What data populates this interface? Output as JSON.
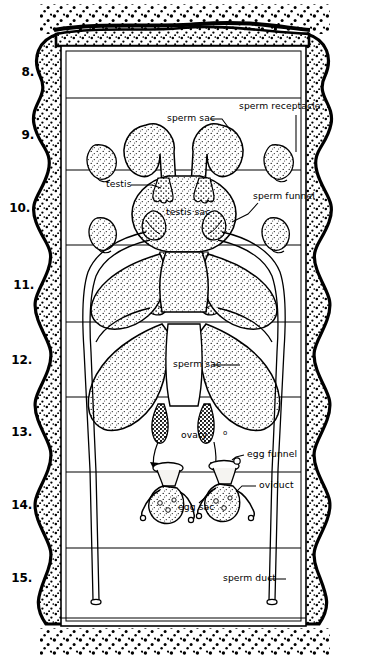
{
  "figure": {
    "background_color": "#ffffff",
    "ink_color": "#000000",
    "stipple_color": "#1a1a1a",
    "organ_fill": "#f2f0ec",
    "width": 365,
    "height": 659
  },
  "segment_numbers": [
    {
      "label": "8.",
      "x": 8,
      "y": 65
    },
    {
      "label": "9.",
      "x": 8,
      "y": 128
    },
    {
      "label": "10.",
      "x": 4,
      "y": 201
    },
    {
      "label": "11.",
      "x": 8,
      "y": 278
    },
    {
      "label": "12.",
      "x": 6,
      "y": 353
    },
    {
      "label": "13.",
      "x": 6,
      "y": 425
    },
    {
      "label": "14.",
      "x": 6,
      "y": 498
    },
    {
      "label": "15.",
      "x": 6,
      "y": 571
    }
  ],
  "labels": [
    {
      "name": "sperm-sac-upper",
      "text": "sperm sac",
      "x": 167,
      "y": 116
    },
    {
      "name": "sperm-receptacle",
      "text": "sperm receptacle",
      "x": 239,
      "y": 104
    },
    {
      "name": "testis",
      "text": "testis",
      "x": 106,
      "y": 182
    },
    {
      "name": "sperm-funnel",
      "text": "sperm funnel",
      "x": 253,
      "y": 194
    },
    {
      "name": "testis-sac",
      "text": "testis sac",
      "x": 166,
      "y": 210
    },
    {
      "name": "sperm-sac-lower",
      "text": "sperm sac",
      "x": 173,
      "y": 362
    },
    {
      "name": "ovary",
      "text": "ovary",
      "x": 181,
      "y": 433
    },
    {
      "name": "egg-funnel",
      "text": "egg funnel",
      "x": 247,
      "y": 452
    },
    {
      "name": "oviduct",
      "text": "oviduct",
      "x": 259,
      "y": 483
    },
    {
      "name": "egg-sac",
      "text": "egg sac",
      "x": 178,
      "y": 505
    },
    {
      "name": "sperm-duct",
      "text": "sperm duct",
      "x": 223,
      "y": 576
    }
  ],
  "ovum_glyph": {
    "name": "ovum-marker",
    "text": "o",
    "x": 223,
    "y": 432
  },
  "structure": {
    "body_wall": "scalloped stippled cuticle border",
    "inner_frame": {
      "left": 61,
      "top": 46,
      "right": 306,
      "bottom": 626
    },
    "septa_y": [
      98,
      170,
      245,
      322,
      397,
      472,
      548
    ],
    "ground_stipple_top": "segment 8 anterior",
    "ground_stipple_bottom": "segment 15 posterior"
  },
  "organs": {
    "sperm_receptacles": 4,
    "sperm_sacs_upper": 2,
    "sperm_sacs_middle": 2,
    "sperm_sacs_lower": 2,
    "testes": 4,
    "testis_sacs": 1,
    "sperm_funnels": 4,
    "ovaries": 2,
    "egg_funnels": 2,
    "egg_sacs": 2,
    "oviducts": 2,
    "sperm_ducts": 2
  }
}
